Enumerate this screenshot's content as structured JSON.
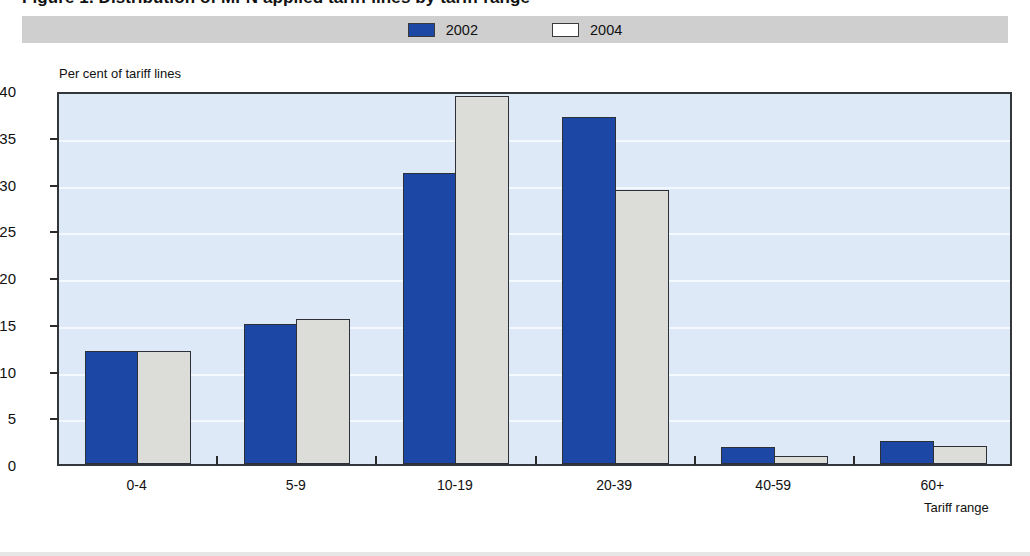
{
  "header": {
    "title": "Figure 1. Distribution of MFN applied tariff lines by tariff range"
  },
  "legend": {
    "position": "top-center",
    "entries": [
      {
        "label": "2002",
        "color": "#1d47a4",
        "swatch": "filled-square-icon"
      },
      {
        "label": "2004",
        "color": "#dcdcd8",
        "swatch": "outlined-square-icon"
      }
    ]
  },
  "axes": {
    "y_title": "Per cent of tariff lines",
    "x_title": "Tariff range",
    "y_ticks": [
      "0",
      "5",
      "10",
      "15",
      "20",
      "25",
      "30",
      "35",
      "40"
    ]
  },
  "colors": {
    "series_2002": "#1d47a4",
    "series_2004": "#dcdcd8",
    "plot_background": "#dde9f6",
    "gridline": "#f4f9ff",
    "axis": "#33373c",
    "legend_background": "#cfcfcf"
  },
  "chart_data": {
    "type": "bar",
    "title": "Figure 1. Distribution of MFN applied tariff lines by tariff range",
    "xlabel": "Tariff range",
    "ylabel": "Per cent of tariff lines",
    "ylim": [
      0,
      40
    ],
    "ytick_step": 5,
    "grid": true,
    "legend_position": "top-center",
    "categories": [
      "0-4",
      "5-9",
      "10-19",
      "20-39",
      "40-59",
      "60+"
    ],
    "series": [
      {
        "name": "2002",
        "color": "#1d47a4",
        "values": [
          12.1,
          15.0,
          31.1,
          37.1,
          1.8,
          2.5
        ]
      },
      {
        "name": "2004",
        "color": "#dcdcd8",
        "values": [
          12.1,
          15.5,
          39.4,
          29.3,
          0.9,
          1.9
        ]
      }
    ]
  }
}
